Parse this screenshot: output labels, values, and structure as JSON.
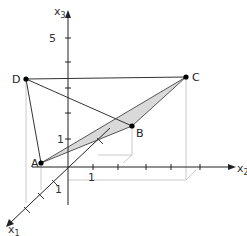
{
  "diagram": {
    "type": "3d-coordinate-system",
    "axes": {
      "x1": {
        "label": "x",
        "sub": "1"
      },
      "x2": {
        "label": "x",
        "sub": "2"
      },
      "x3": {
        "label": "x",
        "sub": "3"
      }
    },
    "tick_labels": {
      "x3_five": "5",
      "x3_one": "1",
      "x2_one": "1",
      "x1_one": "1"
    },
    "points": {
      "A": "A",
      "B": "B",
      "C": "C",
      "D": "D"
    },
    "shaded_face": [
      "A",
      "B",
      "C"
    ],
    "edges": [
      [
        "D",
        "A"
      ],
      [
        "D",
        "C"
      ],
      [
        "D",
        "B"
      ],
      [
        "A",
        "B"
      ],
      [
        "B",
        "C"
      ],
      [
        "A",
        "C"
      ]
    ],
    "colors": {
      "axis": "#222222",
      "edge": "#333333",
      "face_fill": "#d9d9d9",
      "guide": "#bbbbbb",
      "point": "#000000"
    }
  }
}
